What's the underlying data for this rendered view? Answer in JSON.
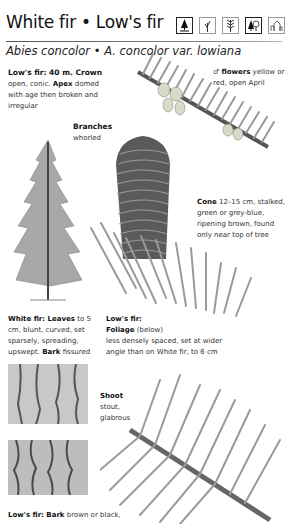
{
  "header": {
    "title": "White fir • Low's fir",
    "subtitle": "Abies concolor • A. concolor var. lowiana",
    "icons": [
      "tree-silhouette-icon",
      "twig-icon",
      "leaf-spray-icon",
      "tree-and-broadleaf-icon",
      "buildings-icon"
    ]
  },
  "captions": {
    "lows_fir_crown": {
      "lead": "Low's fir: 40 m. Crown",
      "text1": "open, conic.",
      "bold1": "Apex",
      "text2": "domed with age then broken and irregular"
    },
    "branches": {
      "lead": "Branches",
      "text": "whorled"
    },
    "flowers": {
      "symbol": "♂",
      "lead": "flowers",
      "text": "yellow or red, open April"
    },
    "cone": {
      "lead": "Cone",
      "text": "12–15 cm, stalked, green or grey-blue, ripening brown, found only near top of tree"
    },
    "white_fir_leaves": {
      "lead": "White fir: Leaves",
      "text1": "to 5 cm, blunt, curved, set sparsely, spreading, upswept.",
      "bold1": "Bark",
      "text2": "fissured"
    },
    "lows_fir_foliage": {
      "lead1": "Low's fir:",
      "lead2": "Foliage",
      "paren": "(below)",
      "text": "less densely spaced, set at wider angle than on White fir, to 6 cm"
    },
    "shoot": {
      "lead": "Shoot",
      "text": "stout, glabrous"
    },
    "lows_fir_bark": {
      "lead": "Low's fir: Bark",
      "text": "brown or black,"
    }
  },
  "colors": {
    "title": "#111111",
    "text": "#333333",
    "rule": "#666666"
  }
}
